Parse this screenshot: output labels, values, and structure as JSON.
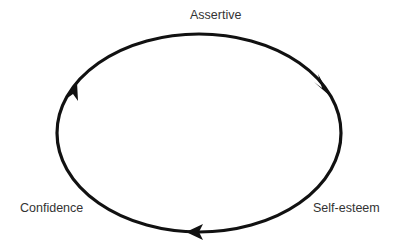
{
  "diagram": {
    "type": "cycle",
    "direction": "clockwise",
    "nodes": [
      {
        "id": "assertive",
        "label": "Assertive",
        "position": "top"
      },
      {
        "id": "self-esteem",
        "label": "Self-esteem",
        "position": "bottom-right"
      },
      {
        "id": "confidence",
        "label": "Confidence",
        "position": "bottom-left"
      }
    ],
    "edges": [
      {
        "from": "Assertive",
        "to": "Self-esteem"
      },
      {
        "from": "Self-esteem",
        "to": "Confidence"
      },
      {
        "from": "Confidence",
        "to": "Assertive"
      }
    ],
    "stroke_color": "#111111",
    "label_color": "#333333"
  }
}
